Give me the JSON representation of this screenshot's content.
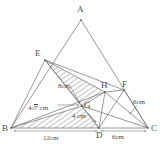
{
  "figure": {
    "type": "geometry-diagram",
    "stroke_color": "#6b6b6b",
    "label_color": "#4a4a4a",
    "hatch_color": "#7a7a7a",
    "background": "#ffffff",
    "width": 163,
    "height": 155
  },
  "vertices": [
    {
      "name": "A",
      "label": "A",
      "x": 81,
      "y": 20
    },
    {
      "name": "E",
      "label": "E",
      "x": 45,
      "y": 60
    },
    {
      "name": "H",
      "label": "H",
      "x": 105,
      "y": 92
    },
    {
      "name": "F",
      "label": "F",
      "x": 124,
      "y": 90
    },
    {
      "name": "G",
      "label": "G",
      "x": 82,
      "y": 106
    },
    {
      "name": "B",
      "label": "B",
      "x": 11,
      "y": 128
    },
    {
      "name": "D",
      "label": "D",
      "x": 99,
      "y": 128
    },
    {
      "name": "C",
      "label": "C",
      "x": 148,
      "y": 128
    }
  ],
  "vertex_labels": [
    {
      "name": "label-A",
      "text": "A",
      "x": 77,
      "y": 5
    },
    {
      "name": "label-E",
      "text": "E",
      "x": 35,
      "y": 49
    },
    {
      "name": "label-H",
      "text": "H",
      "x": 101,
      "y": 81
    },
    {
      "name": "label-F",
      "text": "F",
      "x": 122,
      "y": 80
    },
    {
      "name": "label-G",
      "text": "G",
      "x": 84,
      "y": 101
    },
    {
      "name": "label-B",
      "text": "B",
      "x": 2,
      "y": 124
    },
    {
      "name": "label-D",
      "text": "D",
      "x": 96,
      "y": 131
    },
    {
      "name": "label-C",
      "text": "C",
      "x": 151,
      "y": 124
    }
  ],
  "measurements": [
    {
      "name": "measure-eg",
      "text": "8cm",
      "x": 58,
      "y": 83,
      "kind": "plain"
    },
    {
      "name": "measure-bg",
      "text": "4√7 cm",
      "prefix": "4",
      "radicand": "7",
      "suffix": " cm",
      "x": 28,
      "y": 104,
      "kind": "radical"
    },
    {
      "name": "measure-gd",
      "text": "4 cm",
      "x": 72,
      "y": 113,
      "kind": "plain"
    },
    {
      "name": "measure-bd",
      "text": "12cm",
      "x": 43,
      "y": 135,
      "kind": "plain"
    },
    {
      "name": "measure-dc",
      "text": "6cm",
      "x": 112,
      "y": 134,
      "kind": "plain"
    },
    {
      "name": "measure-fc",
      "text": "6cm",
      "x": 133,
      "y": 99,
      "kind": "plain"
    }
  ],
  "shaded_regions": [
    {
      "name": "shaded-triangle-ehg",
      "points": "45,60 105,92 82,106"
    },
    {
      "name": "shaded-triangle-bgd",
      "points": "11,128 82,106 99,128"
    }
  ],
  "segments": [
    {
      "name": "segment-ab",
      "x1": 81,
      "y1": 20,
      "x2": 11,
      "y2": 128
    },
    {
      "name": "segment-ac",
      "x1": 81,
      "y1": 20,
      "x2": 148,
      "y2": 128
    },
    {
      "name": "segment-bc",
      "x1": 11,
      "y1": 128,
      "x2": 148,
      "y2": 128
    },
    {
      "name": "segment-eg",
      "x1": 45,
      "y1": 60,
      "x2": 82,
      "y2": 106
    },
    {
      "name": "segment-eh",
      "x1": 45,
      "y1": 60,
      "x2": 105,
      "y2": 92
    },
    {
      "name": "segment-ef",
      "x1": 45,
      "y1": 60,
      "x2": 124,
      "y2": 90
    },
    {
      "name": "segment-ed",
      "x1": 45,
      "y1": 60,
      "x2": 99,
      "y2": 128
    },
    {
      "name": "segment-eb",
      "x1": 45,
      "y1": 60,
      "x2": 11,
      "y2": 128
    },
    {
      "name": "segment-bg",
      "x1": 11,
      "y1": 128,
      "x2": 82,
      "y2": 106
    },
    {
      "name": "segment-bh",
      "x1": 11,
      "y1": 128,
      "x2": 105,
      "y2": 92
    },
    {
      "name": "segment-gd",
      "x1": 82,
      "y1": 106,
      "x2": 99,
      "y2": 128
    },
    {
      "name": "segment-gh",
      "x1": 82,
      "y1": 106,
      "x2": 105,
      "y2": 92
    },
    {
      "name": "segment-gc",
      "x1": 82,
      "y1": 106,
      "x2": 148,
      "y2": 128
    },
    {
      "name": "segment-hf",
      "x1": 105,
      "y1": 92,
      "x2": 124,
      "y2": 90
    },
    {
      "name": "segment-hd",
      "x1": 105,
      "y1": 92,
      "x2": 99,
      "y2": 128
    },
    {
      "name": "segment-hc",
      "x1": 105,
      "y1": 92,
      "x2": 148,
      "y2": 128
    },
    {
      "name": "segment-fd",
      "x1": 124,
      "y1": 90,
      "x2": 99,
      "y2": 128
    },
    {
      "name": "segment-fc",
      "x1": 124,
      "y1": 90,
      "x2": 148,
      "y2": 128
    }
  ],
  "dimension_arrows": [
    {
      "name": "dim-arrow-bd",
      "x1": 14,
      "y1": 131,
      "x2": 97,
      "y2": 131
    },
    {
      "name": "dim-arrow-dc",
      "x1": 101,
      "y1": 131,
      "x2": 146,
      "y2": 131
    }
  ],
  "leader_lines": [
    {
      "name": "leader-eg",
      "x1": 70,
      "y1": 86,
      "x2": 80,
      "y2": 103
    },
    {
      "name": "leader-bg",
      "x1": 57,
      "y1": 105,
      "x2": 79,
      "y2": 105
    },
    {
      "name": "leader-gd",
      "x1": 88,
      "y1": 113,
      "x2": 96,
      "y2": 122
    },
    {
      "name": "leader-fc",
      "x1": 137,
      "y1": 105,
      "x2": 130,
      "y2": 114
    }
  ]
}
